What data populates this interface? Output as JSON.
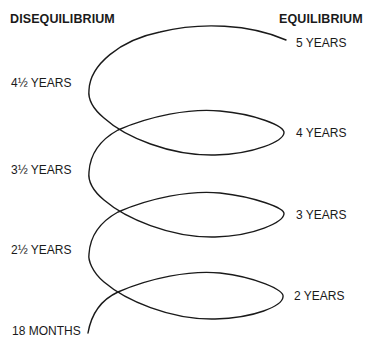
{
  "headers": {
    "left": "DISEQUILIBRIUM",
    "right": "EQUILIBRIUM"
  },
  "equilibrium_labels": [
    {
      "label": "5 YEARS"
    },
    {
      "label": "4 YEARS"
    },
    {
      "label": "3 YEARS"
    },
    {
      "label": "2 YEARS"
    }
  ],
  "disequilibrium_labels": [
    {
      "label": "4½ YEARS"
    },
    {
      "label": "3½ YEARS"
    },
    {
      "label": "2½ YEARS"
    },
    {
      "label": "18 MONTHS"
    }
  ],
  "colors": {
    "line": "#1a1a1a",
    "background": "#ffffff"
  }
}
